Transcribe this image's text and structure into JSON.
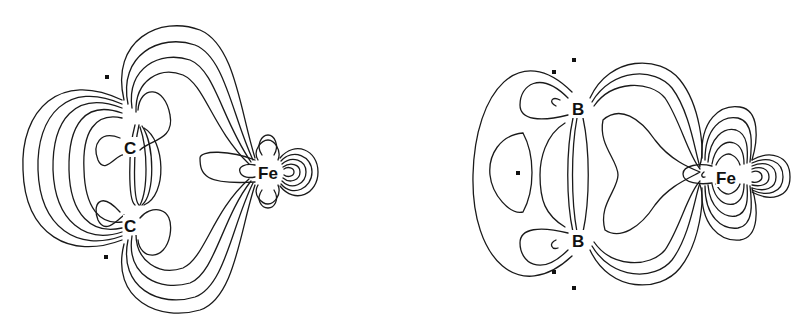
{
  "figure": {
    "left_panel": {
      "atoms": [
        {
          "label": "C",
          "x": 130,
          "y": 147
        },
        {
          "label": "C",
          "x": 130,
          "y": 225
        },
        {
          "label": "Fe",
          "x": 268,
          "y": 172
        }
      ],
      "markers": [
        {
          "x": 107,
          "y": 77
        },
        {
          "x": 106,
          "y": 257
        }
      ]
    },
    "right_panel": {
      "atoms": [
        {
          "label": "B",
          "x": 578,
          "y": 108
        },
        {
          "label": "B",
          "x": 578,
          "y": 240
        },
        {
          "label": "Fe",
          "x": 727,
          "y": 177
        }
      ],
      "markers": [
        {
          "x": 574,
          "y": 60
        },
        {
          "x": 554,
          "y": 72
        },
        {
          "x": 518,
          "y": 173
        },
        {
          "x": 554,
          "y": 272
        },
        {
          "x": 574,
          "y": 288
        }
      ]
    },
    "colors": {
      "line": "#1a1a1a",
      "background": "#ffffff"
    }
  }
}
